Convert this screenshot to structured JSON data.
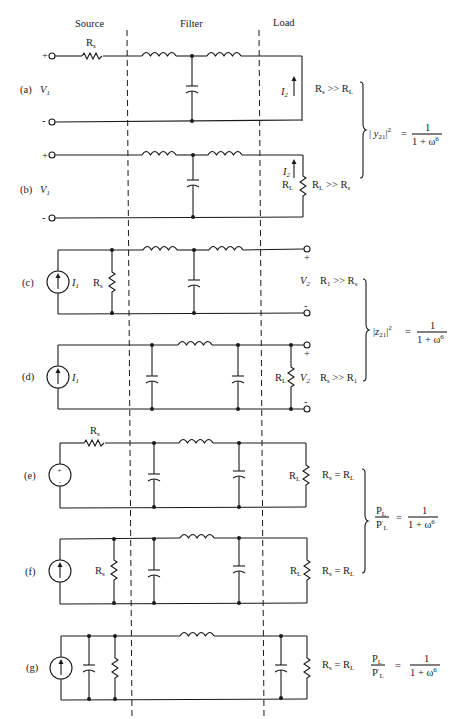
{
  "headers": {
    "source": "Source",
    "filter": "Filter",
    "load": "Load"
  },
  "circuits": {
    "a": {
      "label": "(a)",
      "input": "V",
      "input_sub": "1",
      "plus": "+",
      "minus": "-",
      "source_resistor": "R",
      "source_resistor_sub": "s",
      "current": "I",
      "current_sub": "2",
      "condition": "R",
      "condition_sub1": "s",
      "condition_op": " >> R",
      "condition_sub2": "L"
    },
    "b": {
      "label": "(b)",
      "input": "V",
      "input_sub": "1",
      "plus": "+",
      "minus": "-",
      "current": "I",
      "current_sub": "2",
      "load_resistor": "R",
      "load_resistor_sub": "L",
      "condition": "R",
      "condition_sub1": "L",
      "condition_op": " >> R",
      "condition_sub2": "s"
    },
    "c": {
      "label": "(c)",
      "source_current": "I",
      "source_current_sub": "1",
      "source_resistor": "R",
      "source_resistor_sub": "s",
      "output": "V",
      "output_sub": "2",
      "plus": "+",
      "minus": "-",
      "condition": "R",
      "condition_sub1": "1",
      "condition_op": " >> R",
      "condition_sub2": "s"
    },
    "d": {
      "label": "(d)",
      "source_current": "I",
      "source_current_sub": "1",
      "load_resistor": "R",
      "load_resistor_sub": "L",
      "output": "V",
      "output_sub": "2",
      "plus": "+",
      "minus": "-",
      "condition": "R",
      "condition_sub1": "s",
      "condition_op": " >> R",
      "condition_sub2": "1"
    },
    "e": {
      "label": "(e)",
      "source_resistor": "R",
      "source_resistor_sub": "s",
      "load_resistor": "R",
      "load_resistor_sub": "L",
      "src_plus": "+",
      "src_minus": "-",
      "condition": "R",
      "condition_sub1": "s",
      "condition_op": " = R",
      "condition_sub2": "L"
    },
    "f": {
      "label": "(f)",
      "source_resistor": "R",
      "source_resistor_sub": "s",
      "load_resistor": "R",
      "load_resistor_sub": "L",
      "condition": "R",
      "condition_sub1": "s",
      "condition_op": " = R",
      "condition_sub2": "L"
    },
    "g": {
      "label": "(g)",
      "condition": "R",
      "condition_sub1": "s",
      "condition_op": " = R",
      "condition_sub2": "L"
    }
  },
  "formulas": {
    "y21": {
      "lhs_open": "| ",
      "lhs_var": "y",
      "lhs_sub": "21",
      "lhs_close": "|",
      "lhs_exp": "2",
      "eq": "=",
      "num": "1",
      "den": "1 + ω",
      "den_exp": "6"
    },
    "z21": {
      "lhs_open": "|",
      "lhs_var": "z",
      "lhs_sub": "21",
      "lhs_close": "|",
      "lhs_exp": "2",
      "eq": "=",
      "num": "1",
      "den": "1 + ω",
      "den_exp": "6"
    },
    "power_ef": {
      "num_var": "P",
      "num_sub": "L",
      "den_var": "P",
      "den_sub": "L",
      "den_prime": "′",
      "eq": "=",
      "num": "1",
      "den": "1 + ω",
      "den_exp": "6"
    },
    "power_g": {
      "num_var": "P",
      "num_sub": "L",
      "den_var": "P",
      "den_sub": "L",
      "den_prime": "′",
      "eq": "=",
      "num": "1",
      "den": "1 + ω",
      "den_exp": "6"
    }
  }
}
